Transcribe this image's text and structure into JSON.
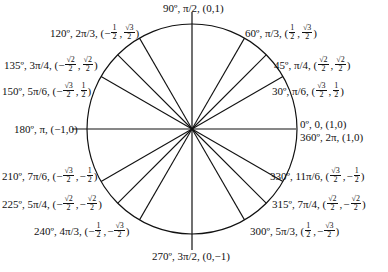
{
  "diagram": {
    "center": [
      192,
      129
    ],
    "radius": 105,
    "stroke_color": "#111111",
    "angles_deg": [
      0,
      30,
      45,
      60,
      90,
      120,
      135,
      150,
      180,
      210,
      225,
      240,
      270,
      300,
      315,
      330
    ]
  },
  "labels": [
    {
      "id": "0",
      "deg": "0º",
      "rad": "0",
      "coord": "(1,0)"
    },
    {
      "id": "360",
      "deg": "360º",
      "rad": "2π",
      "coord": "(1,0)"
    },
    {
      "id": "30",
      "deg": "30º",
      "rad": "π/6",
      "x_num": "√3",
      "x_den": "2",
      "x_sign": "",
      "y_num": "1",
      "y_den": "2",
      "y_sign": ""
    },
    {
      "id": "45",
      "deg": "45º",
      "rad": "π/4",
      "x_num": "√2",
      "x_den": "2",
      "x_sign": "",
      "y_num": "√2",
      "y_den": "2",
      "y_sign": ""
    },
    {
      "id": "60",
      "deg": "60º",
      "rad": "π/3",
      "x_num": "1",
      "x_den": "2",
      "x_sign": "",
      "y_num": "√3",
      "y_den": "2",
      "y_sign": ""
    },
    {
      "id": "90",
      "deg": "90º",
      "rad": "π/2",
      "coord": "(0,1)"
    },
    {
      "id": "120",
      "deg": "120º",
      "rad": "2π/3",
      "x_num": "1",
      "x_den": "2",
      "x_sign": "−",
      "y_num": "√3",
      "y_den": "2",
      "y_sign": ""
    },
    {
      "id": "135",
      "deg": "135º",
      "rad": "3π/4",
      "x_num": "√2",
      "x_den": "2",
      "x_sign": "−",
      "y_num": "√2",
      "y_den": "2",
      "y_sign": ""
    },
    {
      "id": "150",
      "deg": "150º",
      "rad": "5π/6",
      "x_num": "√3",
      "x_den": "2",
      "x_sign": "−",
      "y_num": "1",
      "y_den": "2",
      "y_sign": ""
    },
    {
      "id": "180",
      "deg": "180º",
      "rad": "π",
      "coord": "(−1,0)"
    },
    {
      "id": "210",
      "deg": "210º",
      "rad": "7π/6",
      "x_num": "√3",
      "x_den": "2",
      "x_sign": "−",
      "y_num": "1",
      "y_den": "2",
      "y_sign": "−"
    },
    {
      "id": "225",
      "deg": "225º",
      "rad": "5π/4",
      "x_num": "√2",
      "x_den": "2",
      "x_sign": "−",
      "y_num": "√2",
      "y_den": "2",
      "y_sign": "−"
    },
    {
      "id": "240",
      "deg": "240º",
      "rad": "4π/3",
      "x_num": "1",
      "x_den": "2",
      "x_sign": "−",
      "y_num": "√3",
      "y_den": "2",
      "y_sign": "−"
    },
    {
      "id": "270",
      "deg": "270º",
      "rad": "3π/2",
      "coord": "(0,−1)"
    },
    {
      "id": "300",
      "deg": "300º",
      "rad": "5π/3",
      "x_num": "1",
      "x_den": "2",
      "x_sign": "",
      "y_num": "√3",
      "y_den": "2",
      "y_sign": "−"
    },
    {
      "id": "315",
      "deg": "315º",
      "rad": "7π/4",
      "x_num": "√2",
      "x_den": "2",
      "x_sign": "",
      "y_num": "√2",
      "y_den": "2",
      "y_sign": "−"
    },
    {
      "id": "330",
      "deg": "330º",
      "rad": "11π/6",
      "x_num": "√3",
      "x_den": "2",
      "x_sign": "",
      "y_num": "1",
      "y_den": "2",
      "y_sign": "−"
    }
  ]
}
